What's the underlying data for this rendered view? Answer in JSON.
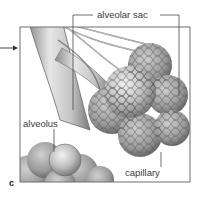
{
  "figure": {
    "panel_letter": "c",
    "labels": {
      "alveolar_sac": "alveolar sac",
      "alveolus": "alveolus",
      "capillary": "capillary"
    },
    "colors": {
      "frame": "#6f6f6f",
      "leader_line": "#4a4a4a",
      "tissue_light": "#d9d9d9",
      "tissue_mid": "#9e9e9e",
      "tissue_dark": "#5c5c5c",
      "background": "#ffffff"
    }
  }
}
